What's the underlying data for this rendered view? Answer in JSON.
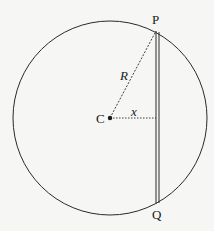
{
  "diagram": {
    "labels": {
      "P": "P",
      "Q": "Q",
      "C": "C",
      "R": "R",
      "x": "x"
    },
    "colors": {
      "stroke": "#2a2a2a",
      "background": "#f6f6f4"
    }
  }
}
